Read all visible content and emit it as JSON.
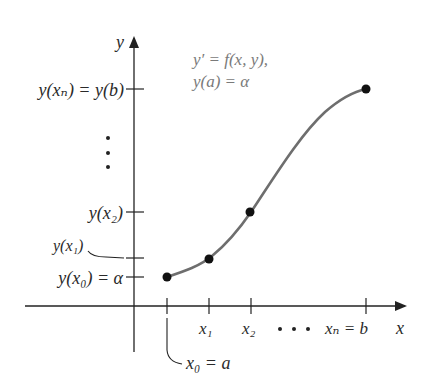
{
  "diagram": {
    "equation": {
      "line1": "y′ = f(x, y),",
      "line2": "y(a) = α"
    },
    "axes": {
      "x_label": "x",
      "y_label": "y"
    },
    "y_ticks": [
      {
        "label": "y(xₙ) = y(b)"
      },
      {
        "label": "y(x₂)"
      },
      {
        "label": "y(x₁)"
      },
      {
        "label": "y(x₀) = α"
      }
    ],
    "y_ellipsis": "⋮",
    "x_ticks": [
      {
        "label": "x₁"
      },
      {
        "label": "x₂"
      },
      {
        "label": "xₙ = b"
      }
    ],
    "x_ellipsis": ". . .",
    "x0_label": "x₀ = a",
    "colors": {
      "axis": "#222222",
      "curve": "#6e6e6e",
      "points": "#111111",
      "equation_text": "#7a7a7a"
    }
  }
}
